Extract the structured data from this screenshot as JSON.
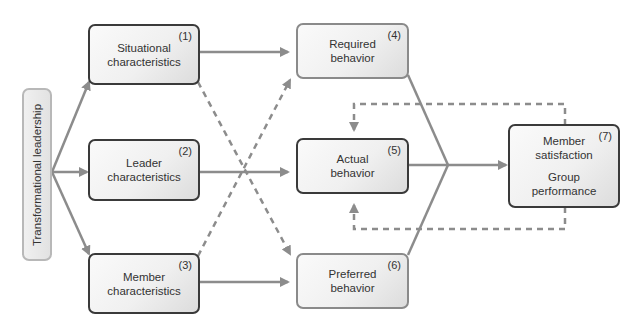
{
  "diagram": {
    "title": "Transformational leadership",
    "nodes": [
      {
        "id": 1,
        "number": "(1)",
        "lines": [
          "Situational",
          "characteristics"
        ]
      },
      {
        "id": 2,
        "number": "(2)",
        "lines": [
          "Leader",
          "characteristics"
        ]
      },
      {
        "id": 3,
        "number": "(3)",
        "lines": [
          "Member",
          "characteristics"
        ]
      },
      {
        "id": 4,
        "number": "(4)",
        "lines": [
          "Required",
          "behavior"
        ]
      },
      {
        "id": 5,
        "number": "(5)",
        "lines": [
          "Actual",
          "behavior"
        ]
      },
      {
        "id": 6,
        "number": "(6)",
        "lines": [
          "Preferred",
          "behavior"
        ]
      },
      {
        "id": 7,
        "number": "(7)",
        "lines": [
          "Member",
          "satisfaction",
          "Group",
          "performance"
        ]
      }
    ],
    "edges": [
      {
        "from": "Transformational leadership",
        "to": 1,
        "style": "solid"
      },
      {
        "from": "Transformational leadership",
        "to": 2,
        "style": "solid"
      },
      {
        "from": "Transformational leadership",
        "to": 3,
        "style": "solid"
      },
      {
        "from": 1,
        "to": 4,
        "style": "solid"
      },
      {
        "from": 1,
        "to": 6,
        "style": "dashed"
      },
      {
        "from": 2,
        "to": 5,
        "style": "solid"
      },
      {
        "from": 3,
        "to": 6,
        "style": "solid"
      },
      {
        "from": 3,
        "to": 4,
        "style": "dashed"
      },
      {
        "from": [
          4,
          5,
          6
        ],
        "to": 7,
        "style": "solid"
      },
      {
        "from": 7,
        "to": 5,
        "style": "dashed",
        "note": "feedback top"
      },
      {
        "from": 7,
        "to": 5,
        "style": "dashed",
        "note": "feedback bottom"
      }
    ],
    "colors": {
      "line": "#8c8c8c",
      "dark_border": "#3a3a3a",
      "light_border": "#8a8a8a"
    }
  }
}
